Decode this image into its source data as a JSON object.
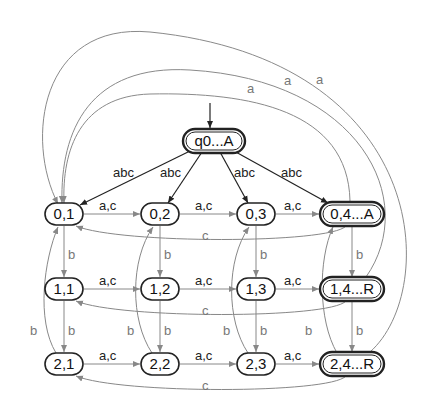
{
  "diagram": {
    "type": "automaton",
    "start_state": "q0...A",
    "nodes": [
      {
        "id": "q0",
        "label": "q0...A",
        "x": 214,
        "y": 141,
        "w": 62,
        "accepting": true
      },
      {
        "id": "n01",
        "label": "0,1",
        "x": 64,
        "y": 214,
        "w": 38,
        "accepting": false
      },
      {
        "id": "n02",
        "label": "0,2",
        "x": 160,
        "y": 214,
        "w": 38,
        "accepting": false
      },
      {
        "id": "n03",
        "label": "0,3",
        "x": 256,
        "y": 214,
        "w": 38,
        "accepting": false
      },
      {
        "id": "n04",
        "label": "0,4...A",
        "x": 352,
        "y": 214,
        "w": 64,
        "accepting": true
      },
      {
        "id": "n11",
        "label": "1,1",
        "x": 64,
        "y": 289,
        "w": 38,
        "accepting": false
      },
      {
        "id": "n12",
        "label": "1,2",
        "x": 160,
        "y": 289,
        "w": 38,
        "accepting": false
      },
      {
        "id": "n13",
        "label": "1,3",
        "x": 256,
        "y": 289,
        "w": 38,
        "accepting": false
      },
      {
        "id": "n14",
        "label": "1,4...R",
        "x": 352,
        "y": 289,
        "w": 64,
        "accepting": true
      },
      {
        "id": "n21",
        "label": "2,1",
        "x": 64,
        "y": 364,
        "w": 38,
        "accepting": false
      },
      {
        "id": "n22",
        "label": "2,2",
        "x": 160,
        "y": 364,
        "w": 38,
        "accepting": false
      },
      {
        "id": "n23",
        "label": "2,3",
        "x": 256,
        "y": 364,
        "w": 38,
        "accepting": false
      },
      {
        "id": "n24",
        "label": "2,4...R",
        "x": 352,
        "y": 364,
        "w": 64,
        "accepting": true
      }
    ],
    "edge_labels": {
      "abc": "abc",
      "ac": "a,c",
      "b": "b",
      "c": "c",
      "a": "a"
    },
    "edges": [
      {
        "from": "q0...A",
        "to": "0,1",
        "label": "abc"
      },
      {
        "from": "q0...A",
        "to": "0,2",
        "label": "abc"
      },
      {
        "from": "q0...A",
        "to": "0,3",
        "label": "abc"
      },
      {
        "from": "q0...A",
        "to": "0,4...A",
        "label": "abc"
      },
      {
        "from": "0,1",
        "to": "0,2",
        "label": "a,c"
      },
      {
        "from": "0,2",
        "to": "0,3",
        "label": "a,c"
      },
      {
        "from": "0,3",
        "to": "0,4...A",
        "label": "a,c"
      },
      {
        "from": "1,1",
        "to": "1,2",
        "label": "a,c"
      },
      {
        "from": "1,2",
        "to": "1,3",
        "label": "a,c"
      },
      {
        "from": "1,3",
        "to": "1,4...R",
        "label": "a,c"
      },
      {
        "from": "2,1",
        "to": "2,2",
        "label": "a,c"
      },
      {
        "from": "2,2",
        "to": "2,3",
        "label": "a,c"
      },
      {
        "from": "2,3",
        "to": "2,4...R",
        "label": "a,c"
      },
      {
        "from": "0,1",
        "to": "1,1",
        "label": "b"
      },
      {
        "from": "0,2",
        "to": "1,2",
        "label": "b"
      },
      {
        "from": "0,3",
        "to": "1,3",
        "label": "b"
      },
      {
        "from": "0,4...A",
        "to": "1,4...R",
        "label": "b"
      },
      {
        "from": "1,1",
        "to": "2,1",
        "label": "b"
      },
      {
        "from": "1,2",
        "to": "2,2",
        "label": "b"
      },
      {
        "from": "1,3",
        "to": "2,3",
        "label": "b"
      },
      {
        "from": "1,4...R",
        "to": "2,4...R",
        "label": "b"
      },
      {
        "from": "2,1",
        "to": "0,1",
        "label": "b"
      },
      {
        "from": "2,2",
        "to": "0,2",
        "label": "b"
      },
      {
        "from": "2,3",
        "to": "0,3",
        "label": "b"
      },
      {
        "from": "2,4...R",
        "to": "0,4...A",
        "label": "b"
      },
      {
        "from": "0,4...A",
        "to": "0,1",
        "label": "c"
      },
      {
        "from": "1,4...R",
        "to": "1,1",
        "label": "c"
      },
      {
        "from": "2,4...R",
        "to": "2,1",
        "label": "c"
      },
      {
        "from": "0,4...A",
        "to": "0,1",
        "label": "a"
      },
      {
        "from": "1,4...R",
        "to": "0,1",
        "label": "a"
      },
      {
        "from": "2,4...R",
        "to": "0,1",
        "label": "a"
      }
    ]
  }
}
